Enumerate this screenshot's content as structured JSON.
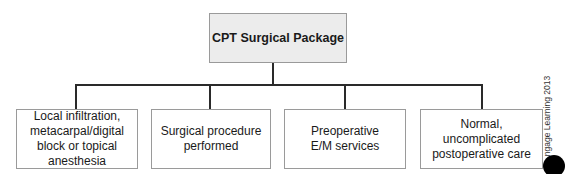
{
  "diagram": {
    "root": {
      "label": "CPT Surgical Package"
    },
    "children": [
      {
        "label": "Local infiltration, metacarpal/digital block or topical anesthesia"
      },
      {
        "label": "Surgical procedure performed"
      },
      {
        "label": "Preoperative E/M services"
      },
      {
        "label": "Normal, uncomplicated postoperative care"
      }
    ],
    "credit": "ngage Learning 2013",
    "colors": {
      "root_fill": "#ececec",
      "box_border": "#9a9a9a",
      "connector": "#2a2a2a"
    }
  }
}
